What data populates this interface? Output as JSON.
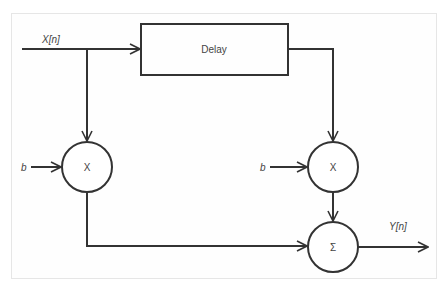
{
  "diagram": {
    "input_label": "X[n]",
    "output_label": "Y[n]",
    "delay_label": "Delay",
    "left_gain_label": "b",
    "right_gain_label": "b",
    "left_multiplier_symbol": "X",
    "right_multiplier_symbol": "X",
    "sum_symbol": "Σ",
    "colors": {
      "stroke": "#333333",
      "frame": "#e6e6e6",
      "text": "#444444"
    }
  }
}
